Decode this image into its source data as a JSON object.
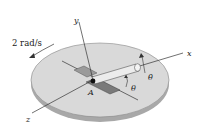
{
  "diagram": {
    "angular_velocity_label": "2 rad/s",
    "axes": {
      "x": "x",
      "y": "y",
      "z": "z"
    },
    "point_label": "A",
    "angle_label": "θ",
    "angle_rate_label": "θ̇",
    "colors": {
      "disk_top": "#d9d9d9",
      "disk_edge": "#a8a8a8",
      "rod": "#e6e6e6",
      "slot": "#8a8a8a",
      "line": "#333333"
    }
  }
}
